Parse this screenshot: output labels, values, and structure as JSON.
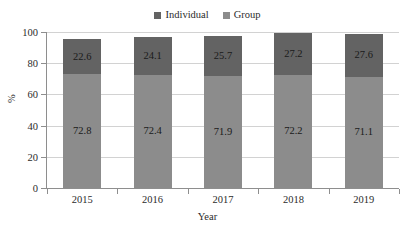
{
  "chart_data": {
    "type": "bar",
    "subtype": "stacked-bar",
    "title": "",
    "xlabel": "Year",
    "ylabel": "%",
    "categories": [
      "2015",
      "2016",
      "2017",
      "2018",
      "2019"
    ],
    "series": [
      {
        "name": "Group",
        "values": [
          72.8,
          72.4,
          71.9,
          72.2,
          71.1
        ],
        "color": "#8c8c8c",
        "stack_position": "bottom"
      },
      {
        "name": "Individual",
        "values": [
          22.6,
          24.1,
          25.7,
          27.2,
          27.6
        ],
        "color": "#636363",
        "stack_position": "top"
      }
    ],
    "ylim": [
      0,
      100
    ],
    "yticks": [
      0,
      20,
      40,
      60,
      80,
      100
    ],
    "ytick_labels": [
      "0",
      "20",
      "40",
      "60",
      "80",
      "100"
    ],
    "grid": true,
    "grid_axis": "y",
    "legend_position": "top-center",
    "data_labels": true
  },
  "legend": {
    "entries": [
      {
        "label": "Individual",
        "color": "#636363"
      },
      {
        "label": "Group",
        "color": "#8c8c8c"
      }
    ]
  },
  "axes": {
    "y_title": "%",
    "x_title": "Year"
  }
}
